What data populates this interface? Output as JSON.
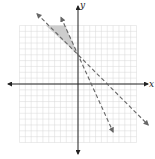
{
  "chart_data": {
    "type": "line",
    "title": "",
    "xlabel": "x",
    "ylabel": "y",
    "xlim": [
      -10,
      10
    ],
    "ylim": [
      -10,
      10
    ],
    "grid": true,
    "grid_step": 1,
    "series": [
      {
        "name": "boundary line 1",
        "equation": "y = -x + 5",
        "style": "dashed",
        "slope": -1,
        "intercept": 5
      },
      {
        "name": "boundary line 2",
        "equation": "y = -2x + 5",
        "style": "dashed",
        "slope": -2.2,
        "intercept": 5
      }
    ],
    "shaded_region": {
      "description": "region above both dashed lines, left of the y-axis",
      "vertices": [
        [
          -5.5,
          10
        ],
        [
          -2.2,
          10
        ],
        [
          0,
          5
        ]
      ],
      "color": "#c8c8c8"
    }
  },
  "labels": {
    "x_axis": "x",
    "y_axis": "y"
  },
  "colors": {
    "grid": "#d9d9d9",
    "axis": "#222222",
    "line": "#555555",
    "shade": "#c8c8c8"
  }
}
